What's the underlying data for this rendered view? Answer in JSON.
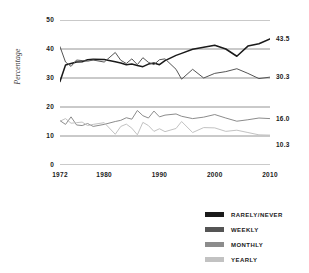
{
  "chart_data": {
    "type": "line",
    "title": "",
    "xlabel": "",
    "ylabel": "Percentage",
    "xlim": [
      1972,
      2010
    ],
    "ylim": [
      0,
      50
    ],
    "grid": true,
    "legend_position": "bottom-right",
    "xticks": [
      "1972",
      "1980",
      "1990",
      "2000",
      "2010"
    ],
    "yticks": [
      "0",
      "10",
      "20",
      "30",
      "40",
      "50"
    ],
    "x": [
      1972,
      1973,
      1974,
      1975,
      1976,
      1977,
      1978,
      1980,
      1982,
      1983,
      1984,
      1985,
      1986,
      1987,
      1988,
      1989,
      1990,
      1991,
      1993,
      1994,
      1996,
      1998,
      2000,
      2002,
      2004,
      2006,
      2008,
      2010
    ],
    "series": [
      {
        "name": "RARELY/NEVER",
        "color": "#1a1a1a",
        "end_label": "43.5",
        "end_value": 43.5,
        "values": [
          28.8,
          34.5,
          35.0,
          35.5,
          35.6,
          36.3,
          36.5,
          36.4,
          35.6,
          35.2,
          34.6,
          34.8,
          34.3,
          33.9,
          34.8,
          35.2,
          34.6,
          36.0,
          37.8,
          38.5,
          39.9,
          40.6,
          41.3,
          40.0,
          37.5,
          41.0,
          41.8,
          43.5
        ]
      },
      {
        "name": "WEEKLY",
        "color": "#555555",
        "end_label": "30.3",
        "end_value": 30.3,
        "values": [
          40.8,
          35.5,
          34.0,
          36.2,
          36.0,
          35.8,
          36.2,
          35.5,
          38.8,
          36.1,
          35.0,
          36.6,
          34.6,
          37.0,
          35.4,
          34.6,
          36.3,
          36.6,
          33.0,
          29.6,
          33.0,
          30.0,
          31.6,
          32.2,
          33.2,
          31.6,
          29.8,
          30.3
        ]
      },
      {
        "name": "MONTHLY",
        "color": "#8c8c8c",
        "end_label": "16.0",
        "end_value": 16.0,
        "values": [
          15.3,
          14.0,
          16.6,
          13.8,
          13.6,
          14.3,
          13.3,
          14.0,
          15.0,
          15.4,
          16.3,
          15.8,
          18.8,
          17.0,
          16.2,
          18.6,
          16.6,
          17.2,
          17.6,
          16.8,
          16.0,
          16.5,
          17.4,
          16.2,
          15.1,
          15.6,
          16.2,
          16.0
        ]
      },
      {
        "name": "YEARLY",
        "color": "#c2c2c2",
        "end_label": "10.3",
        "end_value": 10.3,
        "values": [
          15.1,
          16.0,
          14.4,
          14.6,
          14.8,
          13.6,
          14.0,
          14.6,
          10.6,
          13.3,
          14.1,
          12.7,
          10.4,
          14.7,
          13.6,
          11.6,
          12.5,
          11.5,
          12.6,
          15.0,
          11.2,
          12.9,
          12.8,
          11.6,
          12.0,
          11.2,
          10.4,
          10.3
        ]
      }
    ]
  },
  "legend": {
    "items": [
      {
        "label": "RARELY/NEVER",
        "color": "#1a1a1a"
      },
      {
        "label": "WEEKLY",
        "color": "#555555"
      },
      {
        "label": "MONTHLY",
        "color": "#8c8c8c"
      },
      {
        "label": "YEARLY",
        "color": "#c2c2c2"
      }
    ]
  }
}
